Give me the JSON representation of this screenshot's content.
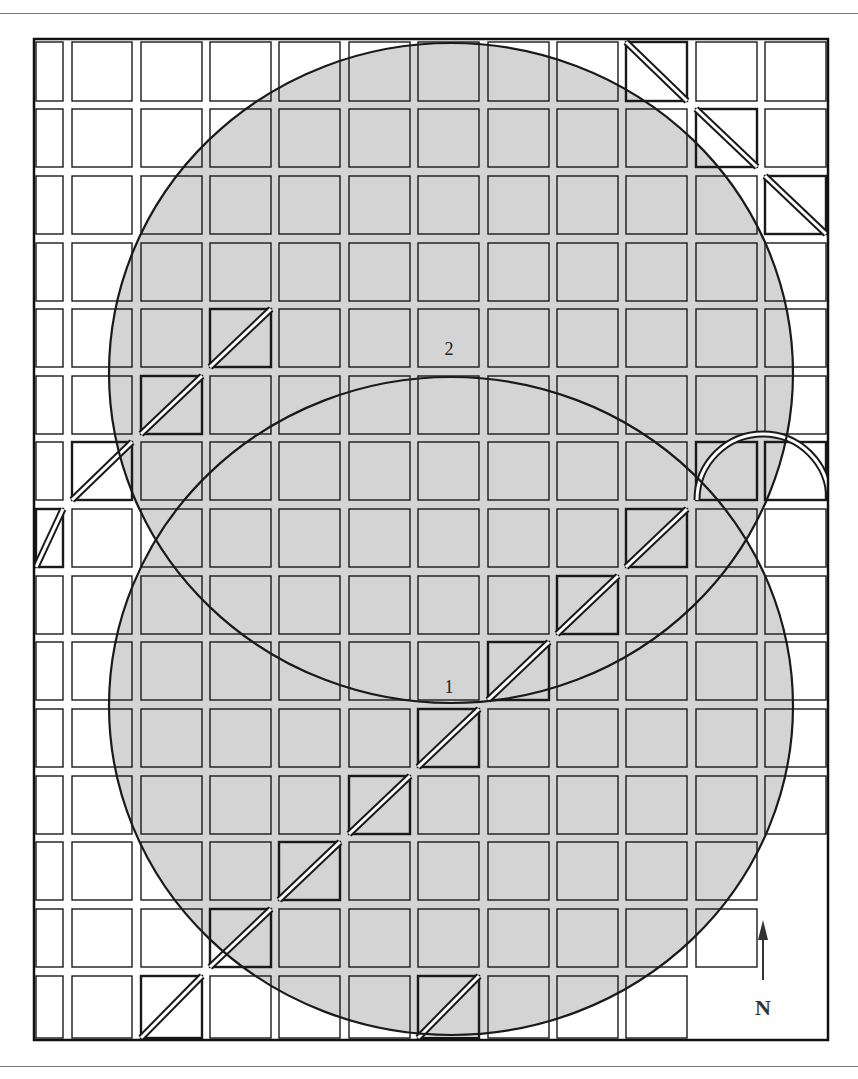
{
  "figure": {
    "type": "grid-diagram",
    "frame": {
      "x": 33,
      "y": 38,
      "width": 796,
      "height": 1003
    },
    "top_rule_y": 13,
    "bottom_rule_y": 1066,
    "colors": {
      "shade": "#d4d4d4",
      "line": "#1a1a1a",
      "background": "#ffffff"
    },
    "columns": [
      {
        "x": 36,
        "w": 27
      },
      {
        "x": 72,
        "w": 60
      },
      {
        "x": 141,
        "w": 61
      },
      {
        "x": 210,
        "w": 61
      },
      {
        "x": 279,
        "w": 61
      },
      {
        "x": 349,
        "w": 61
      },
      {
        "x": 418,
        "w": 61
      },
      {
        "x": 488,
        "w": 61
      },
      {
        "x": 557,
        "w": 61
      },
      {
        "x": 626,
        "w": 61
      },
      {
        "x": 696,
        "w": 61
      },
      {
        "x": 765,
        "w": 61
      }
    ],
    "rows": [
      {
        "y": 42,
        "h": 59
      },
      {
        "y": 109,
        "h": 58
      },
      {
        "y": 176,
        "h": 58
      },
      {
        "y": 243,
        "h": 58
      },
      {
        "y": 309,
        "h": 58
      },
      {
        "y": 376,
        "h": 58
      },
      {
        "y": 442,
        "h": 58
      },
      {
        "y": 509,
        "h": 58
      },
      {
        "y": 576,
        "h": 58
      },
      {
        "y": 642,
        "h": 58
      },
      {
        "y": 709,
        "h": 58
      },
      {
        "y": 776,
        "h": 58
      },
      {
        "y": 842,
        "h": 58
      },
      {
        "y": 909,
        "h": 58
      },
      {
        "y": 976,
        "h": 62
      }
    ],
    "circles": [
      {
        "id": "1",
        "label": "1",
        "cx": 451,
        "cy": 706,
        "rx": 342,
        "ry": 329,
        "label_x": 449,
        "label_y": 693
      },
      {
        "id": "2",
        "label": "2",
        "cx": 451,
        "cy": 373,
        "rx": 342,
        "ry": 330,
        "label_x": 449,
        "label_y": 355
      }
    ],
    "diagonal_cells_ne": [
      [
        2,
        14
      ],
      [
        3,
        13
      ],
      [
        4,
        12
      ],
      [
        5,
        11
      ],
      [
        6,
        10
      ],
      [
        7,
        9
      ],
      [
        8,
        8
      ],
      [
        9,
        7
      ],
      [
        6,
        14
      ],
      [
        3,
        4
      ],
      [
        2,
        5
      ],
      [
        1,
        6
      ],
      [
        0,
        7
      ]
    ],
    "diagonal_cells_nw": [
      [
        9,
        0
      ],
      [
        10,
        1
      ],
      [
        11,
        2
      ]
    ],
    "arch": {
      "cells": [
        [
          10,
          6
        ],
        [
          11,
          6
        ]
      ],
      "cx": 763,
      "cy": 500,
      "r": 66
    },
    "empty_lower_right": [
      [
        11,
        12
      ],
      [
        11,
        13
      ],
      [
        11,
        14
      ],
      [
        10,
        14
      ]
    ],
    "north_arrow": {
      "label": "N",
      "x": 763,
      "y_top": 920,
      "y_bottom": 995
    }
  }
}
